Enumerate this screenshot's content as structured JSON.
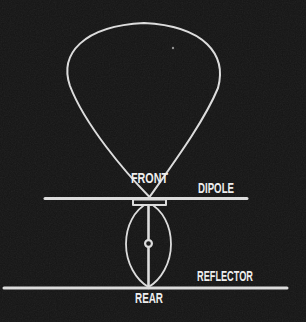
{
  "figure": {
    "labels": {
      "front": "FRONT",
      "dipole": "DIPOLE",
      "rear": "REAR",
      "reflector": "REFLECTOR"
    },
    "colors": {
      "background": "#141414",
      "line": "#dedede",
      "text": "#f0f0f0",
      "speck": "#8f8f8f"
    }
  }
}
